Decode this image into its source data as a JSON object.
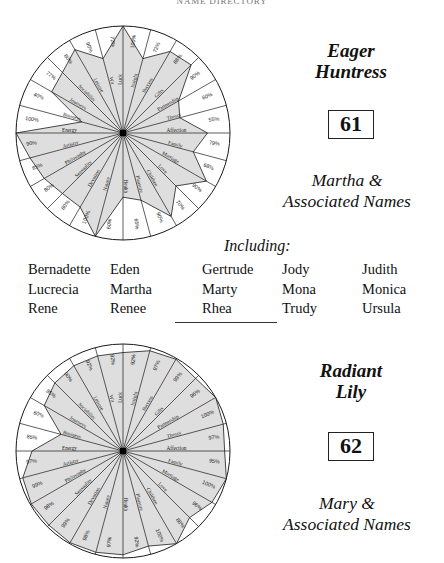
{
  "running_head": "NAME DIRECTORY",
  "entries": [
    {
      "id": "entry-61",
      "epithet": "Eager\nHuntress",
      "epithet_line1": "Eager",
      "epithet_line2": "Huntress",
      "number": "61",
      "heading_line1": "Martha &",
      "heading_line2": "Associated Names",
      "including_label": "Including:",
      "name_columns": [
        [
          "Bernadette",
          "Lucrecia",
          "Rene"
        ],
        [
          "Eden",
          "Martha",
          "Renee"
        ],
        [
          "Gertrude",
          "Marty",
          "Rhea"
        ],
        [
          "Jody",
          "Mona",
          "Trudy"
        ],
        [
          "Judith",
          "Monica",
          "Ursula"
        ]
      ],
      "chart_data": {
        "type": "radar",
        "title": "Martha & Associated Names",
        "subtitle": "Eager Huntress",
        "grid": false,
        "legend": "none",
        "ylim": [
          0,
          100
        ],
        "unit": "%",
        "categories": [
          "Luck",
          "Insight",
          "Success",
          "Gifts",
          "Partnership",
          "Theory",
          "Affection",
          "Family",
          "Marriage",
          "Love",
          "Children",
          "Pleasure",
          "Health",
          "Nature",
          "Devotion",
          "Sensuality",
          "Philosophy",
          "Artistry",
          "Energy",
          "Business",
          "Journeys",
          "Sociability",
          "Leisure",
          "Wit"
        ],
        "values": [
          100,
          72,
          88,
          90,
          60,
          55,
          79,
          68,
          90,
          70,
          90,
          65,
          60,
          100,
          80,
          80,
          85,
          90,
          100,
          40,
          77,
          80,
          90,
          72
        ]
      }
    },
    {
      "id": "entry-62",
      "epithet_line1": "Radiant",
      "epithet_line2": "Lily",
      "number": "62",
      "heading_line1": "Mary &",
      "heading_line2": "Associated Names",
      "chart_data": {
        "type": "radar",
        "title": "Mary & Associated Names",
        "subtitle": "Radiant Lily",
        "grid": false,
        "legend": "none",
        "ylim": [
          0,
          100
        ],
        "unit": "%",
        "categories": [
          "Luck",
          "Insight",
          "Success",
          "Gifts",
          "Partnership",
          "Theory",
          "Affection",
          "Family",
          "Marriage",
          "Love",
          "Children",
          "Pleasure",
          "Health",
          "Nature",
          "Devotion",
          "Sensuality",
          "Philosophy",
          "Artistry",
          "Energy",
          "Business",
          "Journeys",
          "Sociability",
          "Leisure",
          "Wit"
        ],
        "values": [
          92,
          97,
          99,
          96,
          100,
          97,
          95,
          100,
          96,
          88,
          100,
          92,
          97,
          98,
          99,
          98,
          99,
          97,
          85,
          60,
          85,
          90,
          92,
          92
        ]
      }
    }
  ]
}
